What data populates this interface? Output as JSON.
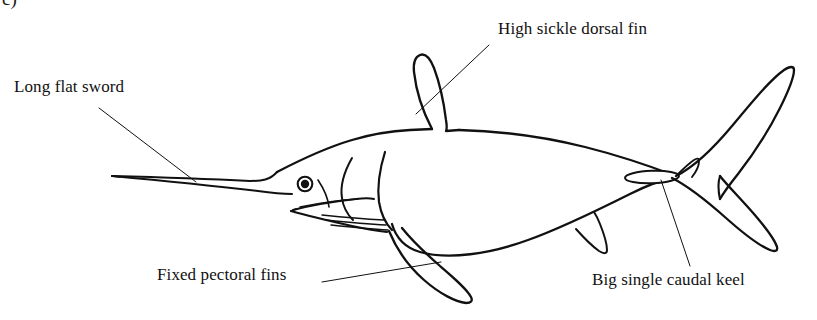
{
  "figure": {
    "marker": "c)",
    "caption_labels_count": 4,
    "ink_color": "#111111",
    "background_color": "#ffffff"
  },
  "labels": {
    "sword": "Long flat sword",
    "dorsal": "High sickle dorsal fin",
    "pectoral": "Fixed pectoral fins",
    "keel": "Big single caudal keel"
  },
  "anatomy": {
    "parts": [
      "long flat sword (bill)",
      "eye",
      "lower jaw",
      "gill membrane lines",
      "high sickle dorsal fin",
      "fixed pectoral fin",
      "small second dorsal fin",
      "anal fin",
      "big single caudal keel",
      "crescent caudal fin"
    ]
  },
  "leaders": {
    "sword": "from label down-right to the sword blade",
    "dorsal": "from label down-left to the dorsal fin",
    "pectoral": "from label up-right to the pectoral fin",
    "keel": "from keel down-right to the label"
  }
}
